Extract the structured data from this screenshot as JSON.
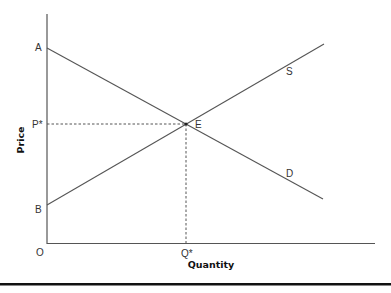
{
  "diagram": {
    "type": "supply-demand",
    "x_axis_label": "Quantity",
    "y_axis_label": "Price",
    "origin_label": "O",
    "labels": {
      "A": "A",
      "B": "B",
      "P_star": "P*",
      "Q_star": "Q*",
      "E": "E",
      "S": "S",
      "D": "D"
    },
    "curves": [
      {
        "name": "Demand",
        "label": "D",
        "from": [
          47,
          48
        ],
        "to": [
          323,
          199
        ]
      },
      {
        "name": "Supply",
        "label": "S",
        "from": [
          47,
          205
        ],
        "to": [
          324,
          44
        ]
      }
    ],
    "equilibrium": {
      "label": "E",
      "x": 186,
      "y": 124
    },
    "colors": {
      "lines": "#555555",
      "axes": "#555555",
      "text": "#333333",
      "rule": "#111111"
    }
  }
}
